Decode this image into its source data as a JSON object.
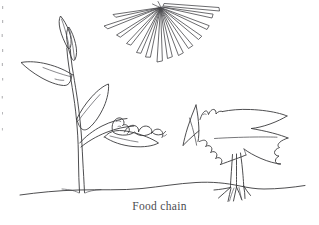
{
  "document": {
    "kind": "hand-drawn-sketch",
    "caption": "Food chain",
    "background_color": "#ffffff",
    "ink_color": "#3a3a3c"
  },
  "figure": {
    "title": "Food chain",
    "elements": [
      {
        "name": "sun",
        "label": "sun",
        "description": "radiating triangular rays converging to a point at top center"
      },
      {
        "name": "plant",
        "label": "plant",
        "description": "double-line stem with pointed leaves and upright bud leaves"
      },
      {
        "name": "caterpillar",
        "label": "caterpillar",
        "description": "humped wavy-bodied larva resting on a leaf"
      },
      {
        "name": "bird",
        "label": "bird",
        "description": "bird with pointed beak, zigzag crest, jagged tail and clawed legs"
      },
      {
        "name": "ground",
        "label": "ground",
        "description": "undulating horizon line across the page"
      }
    ],
    "ray_count": 14
  }
}
